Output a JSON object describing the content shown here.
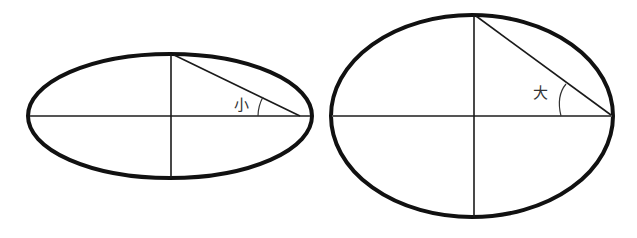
{
  "diagram": {
    "left_ellipse": {
      "angle_label": "小",
      "cx": 170,
      "cy": 116,
      "rx": 142,
      "ry": 62
    },
    "right_ellipse": {
      "angle_label": "大",
      "cx": 472,
      "cy": 116,
      "rx": 142,
      "ry": 102
    },
    "colors": {
      "outline": "#111111",
      "line": "#1a1a1a",
      "axis": "#555555",
      "text": "#333333"
    }
  }
}
